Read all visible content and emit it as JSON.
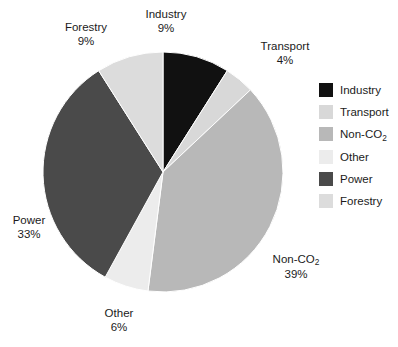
{
  "chart_data": {
    "type": "pie",
    "title": "",
    "categories": [
      "Industry",
      "Transport",
      "Non-CO2",
      "Other",
      "Power",
      "Forestry"
    ],
    "values": [
      9,
      4,
      39,
      6,
      33,
      9
    ],
    "value_labels": [
      "9%",
      "4%",
      "39%",
      "6%",
      "33%",
      "9%"
    ],
    "unit": "%",
    "start_angle_deg": 0,
    "direction": "clockwise",
    "legend_position": "right",
    "grid": false,
    "colors": [
      "#111111",
      "#d8d8d8",
      "#b8b8b8",
      "#ececec",
      "#4a4a4a",
      "#dcdcdc"
    ],
    "slices": [
      {
        "name": "Industry",
        "name_html": "Industry",
        "percent": 9,
        "percent_label": "9%",
        "color": "#111111"
      },
      {
        "name": "Transport",
        "name_html": "Transport",
        "percent": 4,
        "percent_label": "4%",
        "color": "#d8d8d8"
      },
      {
        "name": "Non-CO2",
        "name_html": "Non-CO<sub>2</sub>",
        "percent": 39,
        "percent_label": "39%",
        "color": "#b8b8b8"
      },
      {
        "name": "Other",
        "name_html": "Other",
        "percent": 6,
        "percent_label": "6%",
        "color": "#ececec"
      },
      {
        "name": "Power",
        "name_html": "Power",
        "percent": 33,
        "percent_label": "33%",
        "color": "#4a4a4a"
      },
      {
        "name": "Forestry",
        "name_html": "Forestry",
        "percent": 9,
        "percent_label": "9%",
        "color": "#dcdcdc"
      }
    ]
  },
  "legend": {
    "items": [
      {
        "label": "Industry",
        "label_html": "Industry",
        "color": "#111111"
      },
      {
        "label": "Transport",
        "label_html": "Transport",
        "color": "#d8d8d8"
      },
      {
        "label": "Non-CO2",
        "label_html": "Non-CO<sub>2</sub>",
        "color": "#b8b8b8"
      },
      {
        "label": "Other",
        "label_html": "Other",
        "color": "#ececec"
      },
      {
        "label": "Power",
        "label_html": "Power",
        "color": "#4a4a4a"
      },
      {
        "label": "Forestry",
        "label_html": "Forestry",
        "color": "#dcdcdc"
      }
    ]
  },
  "callouts": [
    {
      "name": "Industry",
      "name_html": "Industry",
      "percent_label": "9%",
      "x": 166,
      "y": 8,
      "align": "center"
    },
    {
      "name": "Transport",
      "name_html": "Transport",
      "percent_label": "4%",
      "x": 285,
      "y": 40,
      "align": "center"
    },
    {
      "name": "Non-CO2",
      "name_html": "Non-CO<sub>2</sub>",
      "percent_label": "39%",
      "x": 296,
      "y": 253,
      "align": "center"
    },
    {
      "name": "Other",
      "name_html": "Other",
      "percent_label": "6%",
      "x": 119,
      "y": 307,
      "align": "center"
    },
    {
      "name": "Power",
      "name_html": "Power",
      "percent_label": "33%",
      "x": 29,
      "y": 214,
      "align": "center"
    },
    {
      "name": "Forestry",
      "name_html": "Forestry",
      "percent_label": "9%",
      "x": 86,
      "y": 21,
      "align": "center"
    }
  ],
  "geometry": {
    "center_x": 163,
    "center_y": 172,
    "radius": 120
  }
}
